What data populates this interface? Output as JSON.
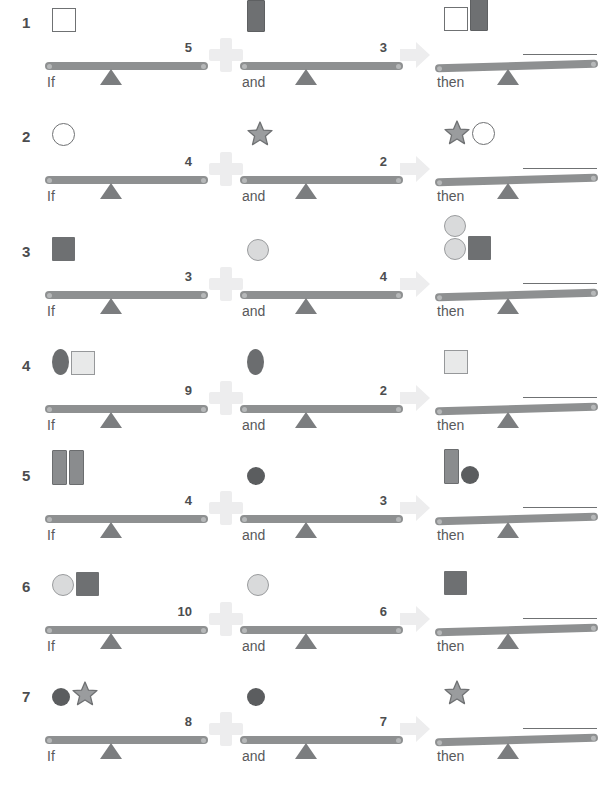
{
  "page": {
    "operators": {
      "plus_icon": "plus-icon",
      "arrow_icon": "arrow-right-icon"
    },
    "captions": {
      "if": "If",
      "and": "and",
      "then": "then"
    }
  },
  "rows": [
    {
      "number": "1",
      "if": {
        "weight": "5",
        "shapes": [
          "square-white"
        ]
      },
      "and": {
        "weight": "3",
        "shapes": [
          "rect-dark-tall"
        ]
      },
      "then": {
        "weight": "",
        "shapes": [
          "square-white",
          "rect-dark-tall"
        ]
      }
    },
    {
      "number": "2",
      "if": {
        "weight": "4",
        "shapes": [
          "circle-white"
        ]
      },
      "and": {
        "weight": "2",
        "shapes": [
          "star-gray"
        ]
      },
      "then": {
        "weight": "",
        "shapes": [
          "star-gray",
          "circle-white"
        ]
      }
    },
    {
      "number": "3",
      "if": {
        "weight": "3",
        "shapes": [
          "square-dark"
        ]
      },
      "and": {
        "weight": "4",
        "shapes": [
          "circle-light"
        ]
      },
      "then": {
        "weight": "",
        "shapes": [
          "circle-light",
          "circle-light",
          "square-dark"
        ]
      }
    },
    {
      "number": "4",
      "if": {
        "weight": "9",
        "shapes": [
          "ellipse-dark",
          "square-light"
        ]
      },
      "and": {
        "weight": "2",
        "shapes": [
          "ellipse-dark"
        ]
      },
      "then": {
        "weight": "",
        "shapes": [
          "square-light"
        ]
      }
    },
    {
      "number": "5",
      "if": {
        "weight": "4",
        "shapes": [
          "rect-tall",
          "rect-tall"
        ]
      },
      "and": {
        "weight": "3",
        "shapes": [
          "circle-dark"
        ]
      },
      "then": {
        "weight": "",
        "shapes": [
          "rect-tall",
          "circle-dark"
        ]
      }
    },
    {
      "number": "6",
      "if": {
        "weight": "10",
        "shapes": [
          "circle-light",
          "square-dark"
        ]
      },
      "and": {
        "weight": "6",
        "shapes": [
          "circle-light"
        ]
      },
      "then": {
        "weight": "",
        "shapes": [
          "square-dark"
        ]
      }
    },
    {
      "number": "7",
      "if": {
        "weight": "8",
        "shapes": [
          "circle-dark",
          "star-gray"
        ]
      },
      "and": {
        "weight": "7",
        "shapes": [
          "circle-dark"
        ]
      },
      "then": {
        "weight": "",
        "shapes": [
          "star-gray"
        ]
      }
    }
  ],
  "colors": {
    "beam": "#8e9091",
    "fulcrum": "#7b7d7f",
    "dark_shape": "#6e7072",
    "light_shape": "#d9dadb",
    "text": "#58595b",
    "operator": "#ededee"
  }
}
